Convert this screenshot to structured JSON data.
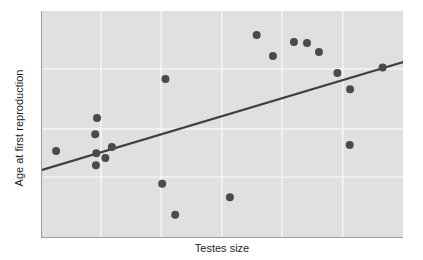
{
  "chart_data": {
    "type": "scatter",
    "title": "",
    "subtitle": "",
    "xlabel": "Testes size",
    "ylabel": "Age at first reproduction",
    "x_tick_labels": [],
    "y_tick_labels": [],
    "grid": true,
    "grid_color": "#f7f7f7",
    "panel_background": "#e0e0e0",
    "point_color": "#4a4a4e",
    "point_radius_px": 4,
    "legend": null,
    "legend_position": "none",
    "xlim": [
      0,
      1
    ],
    "ylim": [
      0,
      1
    ],
    "note": "Axes are unlabeled; values below are normalized 0-1 positions read off the panel (x increases right, y increases up).",
    "series": [
      {
        "name": "species",
        "marker": "filled-circle",
        "points": [
          {
            "x": 0.039,
            "y": 0.383
          },
          {
            "x": 0.15,
            "y": 0.373
          },
          {
            "x": 0.149,
            "y": 0.321
          },
          {
            "x": 0.147,
            "y": 0.457
          },
          {
            "x": 0.152,
            "y": 0.529
          },
          {
            "x": 0.175,
            "y": 0.352
          },
          {
            "x": 0.193,
            "y": 0.401
          },
          {
            "x": 0.332,
            "y": 0.239
          },
          {
            "x": 0.341,
            "y": 0.7
          },
          {
            "x": 0.368,
            "y": 0.102
          },
          {
            "x": 0.519,
            "y": 0.18
          },
          {
            "x": 0.593,
            "y": 0.894
          },
          {
            "x": 0.638,
            "y": 0.802
          },
          {
            "x": 0.696,
            "y": 0.863
          },
          {
            "x": 0.732,
            "y": 0.859
          },
          {
            "x": 0.765,
            "y": 0.819
          },
          {
            "x": 0.816,
            "y": 0.727
          },
          {
            "x": 0.851,
            "y": 0.655
          },
          {
            "x": 0.85,
            "y": 0.41
          },
          {
            "x": 0.941,
            "y": 0.751
          }
        ]
      }
    ],
    "trend_line": {
      "type": "linear-fit",
      "color": "#3f3f42",
      "start": {
        "x": 0.0,
        "y": 0.3
      },
      "end": {
        "x": 1.0,
        "y": 0.776
      }
    },
    "gridlines": {
      "vertical_x": [
        0.163,
        0.329,
        0.497,
        0.663,
        0.831
      ],
      "horizontal_y": [
        0.745,
        0.48,
        0.268
      ]
    }
  }
}
